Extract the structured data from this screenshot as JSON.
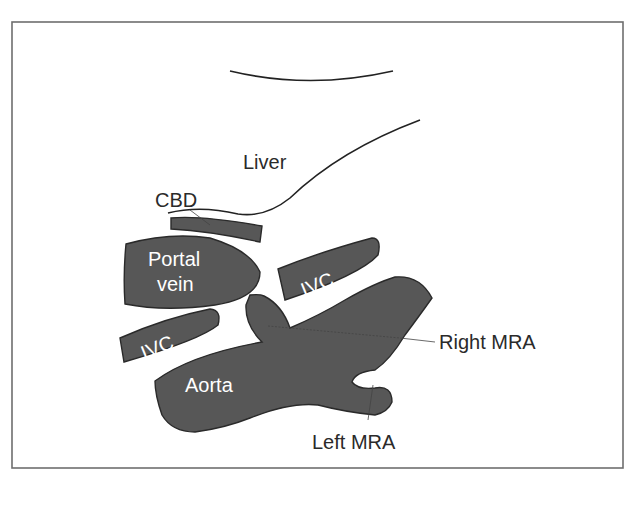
{
  "diagram": {
    "type": "anatomical-schematic",
    "colors": {
      "structure_fill": "#575757",
      "outline": "#2a2a2a",
      "frame": "#6e6e6e",
      "background": "#ffffff",
      "inner_label": "#ffffff",
      "outer_label": "#2a2a2a"
    },
    "labels": {
      "liver": "Liver",
      "cbd": "CBD",
      "portal_vein_line1": "Portal",
      "portal_vein_line2": "vein",
      "ivc_upper": "IVC",
      "ivc_lower": "IVC",
      "aorta": "Aorta",
      "right_mra": "Right MRA",
      "left_mra": "Left MRA"
    },
    "structures": [
      {
        "id": "liver",
        "label": "Liver",
        "rendering": "outline"
      },
      {
        "id": "cbd",
        "label": "CBD",
        "rendering": "filled-band",
        "annotation": "leader-line"
      },
      {
        "id": "portal-vein",
        "label": "Portal vein",
        "rendering": "filled"
      },
      {
        "id": "ivc-upper",
        "label": "IVC",
        "rendering": "filled"
      },
      {
        "id": "ivc-lower",
        "label": "IVC",
        "rendering": "filled"
      },
      {
        "id": "aorta",
        "label": "Aorta",
        "rendering": "filled"
      },
      {
        "id": "right-mra",
        "label": "Right MRA",
        "rendering": "filled",
        "annotation": "leader-line"
      },
      {
        "id": "left-mra",
        "label": "Left MRA",
        "rendering": "filled",
        "annotation": "leader-line"
      }
    ]
  }
}
